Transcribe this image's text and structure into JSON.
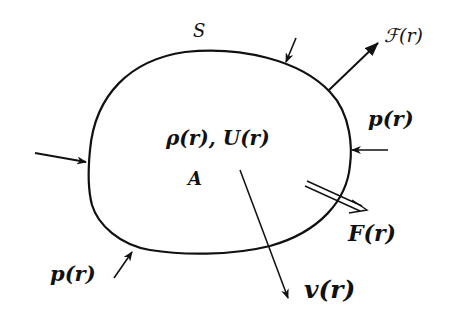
{
  "diagram": {
    "type": "free-body / continuum region",
    "labels": {
      "surface": "S",
      "region": "A",
      "density_energy": "ρ(r), U(r)",
      "surface_force": "ℱ(r)",
      "pressure_right": "p(r)",
      "pressure_bottom_left": "p(r)",
      "body_force": "F(r)",
      "velocity": "v(r)"
    },
    "colors": {
      "ink": "#111111",
      "background": "#ffffff"
    }
  }
}
